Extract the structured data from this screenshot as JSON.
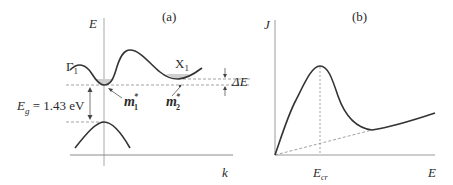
{
  "panel_a": {
    "title": "(a)",
    "y_axis_label": "E",
    "x_axis_label": "k",
    "valley_gamma_label": "Γ",
    "valley_gamma_sub": "1",
    "valley_x_label": "X",
    "valley_x_sub": "1",
    "mass1_label": "m",
    "mass1_sub": "1",
    "mass1_sup": "*",
    "mass2_label": "m",
    "mass2_sub": "2",
    "mass2_sup": "*",
    "delta_e_label": "ΔE",
    "gap_label_symbol": "E",
    "gap_label_sub": "g",
    "gap_label_value": " = 1.43 eV"
  },
  "panel_b": {
    "title": "(b)",
    "y_axis_label": "J",
    "x_axis_label": "E",
    "critical_field_label": "E",
    "critical_field_sub": "cr"
  },
  "colors": {
    "curve": "#333333",
    "axis": "#9a9a9a",
    "dashed": "#8a8a8a",
    "fill": "#cfcfcf",
    "text": "#2a2a2a"
  }
}
